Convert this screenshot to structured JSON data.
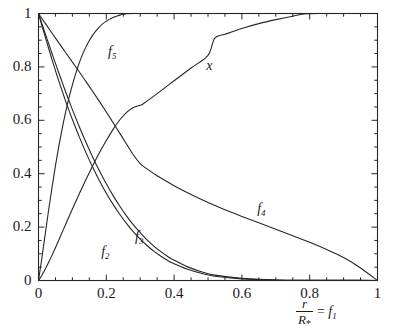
{
  "chart_data": {
    "type": "line",
    "title": "",
    "xlabel": "r/R_* = f_1",
    "ylabel": "",
    "xlim": [
      0,
      1
    ],
    "ylim": [
      0,
      1
    ],
    "grid": false,
    "legend_position": "inline-annotations",
    "xticks": [
      "0",
      "0.2",
      "0.4",
      "0.6",
      "0.8",
      "1"
    ],
    "xtick_values": [
      0,
      0.2,
      0.4,
      0.6,
      0.8,
      1
    ],
    "yticks": [
      "0",
      "0.2",
      "0.4",
      "0.6",
      "0.8",
      "1"
    ],
    "ytick_values": [
      0,
      0.2,
      0.4,
      0.6,
      0.8,
      1
    ],
    "minor_tick_step": 0.05,
    "line_color": "#262626",
    "frame_color": "#262626",
    "series": [
      {
        "name": "f2",
        "label": "f",
        "sub": "2",
        "label_x": 0.185,
        "label_y": 0.105,
        "x": [
          0,
          0.01,
          0.02,
          0.03,
          0.04,
          0.05,
          0.06,
          0.07,
          0.08,
          0.09,
          0.1,
          0.12,
          0.14,
          0.16,
          0.18,
          0.2,
          0.22,
          0.24,
          0.26,
          0.28,
          0.3,
          0.32,
          0.34,
          0.36,
          0.38,
          0.4,
          0.44,
          0.48,
          0.52,
          0.6,
          0.7,
          0.8,
          0.9,
          1.0
        ],
        "y": [
          1.0,
          0.955,
          0.912,
          0.869,
          0.827,
          0.786,
          0.747,
          0.709,
          0.672,
          0.637,
          0.603,
          0.539,
          0.479,
          0.424,
          0.373,
          0.327,
          0.285,
          0.247,
          0.213,
          0.182,
          0.155,
          0.131,
          0.11,
          0.092,
          0.076,
          0.063,
          0.042,
          0.027,
          0.016,
          0.006,
          0.002,
          0.001,
          0.0005,
          0.0
        ]
      },
      {
        "name": "f3",
        "label": "f",
        "sub": "3",
        "label_x": 0.285,
        "label_y": 0.163,
        "x": [
          0,
          0.01,
          0.02,
          0.03,
          0.04,
          0.05,
          0.06,
          0.07,
          0.08,
          0.09,
          0.1,
          0.12,
          0.14,
          0.16,
          0.18,
          0.2,
          0.22,
          0.24,
          0.26,
          0.28,
          0.3,
          0.32,
          0.34,
          0.36,
          0.38,
          0.4,
          0.44,
          0.48,
          0.52,
          0.6,
          0.7,
          0.8,
          0.9,
          1.0
        ],
        "y": [
          1.0,
          0.962,
          0.924,
          0.887,
          0.85,
          0.813,
          0.777,
          0.742,
          0.707,
          0.673,
          0.64,
          0.577,
          0.518,
          0.462,
          0.41,
          0.362,
          0.318,
          0.278,
          0.241,
          0.208,
          0.179,
          0.152,
          0.129,
          0.109,
          0.091,
          0.076,
          0.051,
          0.033,
          0.02,
          0.008,
          0.002,
          0.001,
          0.0005,
          0.0
        ]
      },
      {
        "name": "f4",
        "label": "f",
        "sub": "4",
        "label_x": 0.645,
        "label_y": 0.268,
        "x": [
          0,
          0.02,
          0.04,
          0.06,
          0.08,
          0.1,
          0.12,
          0.14,
          0.16,
          0.18,
          0.2,
          0.22,
          0.24,
          0.26,
          0.28,
          0.3,
          0.32,
          0.35,
          0.4,
          0.45,
          0.5,
          0.55,
          0.6,
          0.65,
          0.7,
          0.75,
          0.8,
          0.85,
          0.9,
          0.95,
          1.0
        ],
        "y": [
          1.0,
          0.963,
          0.926,
          0.89,
          0.854,
          0.818,
          0.782,
          0.745,
          0.708,
          0.67,
          0.631,
          0.591,
          0.551,
          0.51,
          0.47,
          0.438,
          0.418,
          0.392,
          0.355,
          0.322,
          0.292,
          0.265,
          0.24,
          0.216,
          0.192,
          0.168,
          0.143,
          0.116,
          0.086,
          0.047,
          0.0
        ]
      },
      {
        "name": "f5",
        "label": "f",
        "sub": "5",
        "label_x": 0.205,
        "label_y": 0.855,
        "x": [
          0,
          0.01,
          0.02,
          0.03,
          0.04,
          0.05,
          0.06,
          0.07,
          0.08,
          0.09,
          0.1,
          0.11,
          0.12,
          0.13,
          0.14,
          0.15,
          0.16,
          0.17,
          0.18,
          0.19,
          0.2,
          0.21,
          0.22,
          0.23,
          0.24,
          0.25,
          0.26,
          0.28,
          0.35,
          0.5,
          0.7,
          1.0
        ],
        "y": [
          0.0,
          0.085,
          0.175,
          0.265,
          0.35,
          0.43,
          0.503,
          0.57,
          0.631,
          0.685,
          0.733,
          0.776,
          0.814,
          0.847,
          0.875,
          0.899,
          0.919,
          0.936,
          0.95,
          0.962,
          0.971,
          0.979,
          0.985,
          0.99,
          0.994,
          0.997,
          0.999,
          1.0,
          1.0,
          1.0,
          1.0,
          1.0
        ]
      },
      {
        "name": "x",
        "label": "x",
        "sub": "",
        "label_x": 0.495,
        "label_y": 0.805,
        "x": [
          0,
          0.01,
          0.02,
          0.03,
          0.04,
          0.05,
          0.06,
          0.08,
          0.1,
          0.12,
          0.14,
          0.16,
          0.18,
          0.2,
          0.22,
          0.24,
          0.26,
          0.28,
          0.3,
          0.31,
          0.35,
          0.4,
          0.45,
          0.5,
          0.52,
          0.55,
          0.6,
          0.65,
          0.7,
          0.75,
          0.79,
          0.85,
          0.9,
          0.95,
          1.0
        ],
        "y": [
          0.0,
          0.02,
          0.043,
          0.068,
          0.095,
          0.123,
          0.152,
          0.21,
          0.268,
          0.324,
          0.378,
          0.43,
          0.479,
          0.524,
          0.566,
          0.602,
          0.63,
          0.648,
          0.656,
          0.663,
          0.7,
          0.748,
          0.796,
          0.843,
          0.908,
          0.922,
          0.944,
          0.962,
          0.977,
          0.99,
          0.999,
          1.0,
          1.0,
          1.0,
          1.0
        ]
      }
    ]
  },
  "axis_title": {
    "numerator": "r",
    "denominator": "R",
    "denominator_sub": "*",
    "equals": "=",
    "rhs": "f",
    "rhs_sub": "1"
  }
}
